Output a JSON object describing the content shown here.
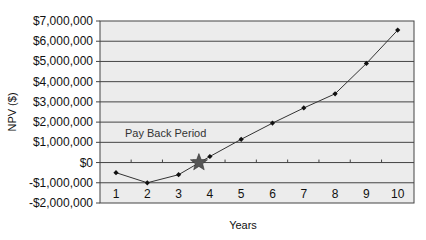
{
  "chart_data": {
    "type": "line",
    "title": "",
    "xlabel": "Years",
    "ylabel": "NPV ($)",
    "x": [
      1,
      2,
      3,
      4,
      5,
      6,
      7,
      8,
      9,
      10
    ],
    "categories": [
      "1",
      "2",
      "3",
      "4",
      "5",
      "6",
      "7",
      "8",
      "9",
      "10"
    ],
    "series": [
      {
        "name": "NPV",
        "values": [
          -500000,
          -1000000,
          -600000,
          300000,
          1150000,
          1950000,
          2700000,
          3400000,
          4900000,
          6550000
        ]
      }
    ],
    "yticks": [
      "$7,000,000",
      "$6,000,000",
      "$5,000,000",
      "$4,000,000",
      "$3,000,000",
      "$2,000,000",
      "$1,000,000",
      "$0",
      "-$1,000,000",
      "-$2,000,000"
    ],
    "ylim": [
      -2000000,
      7000000
    ],
    "grid": true,
    "legend": "none",
    "annotations": [
      {
        "text": "Pay Back Period",
        "marker": "star",
        "x": 3.65,
        "y": 0
      }
    ]
  },
  "colors": {
    "plot_bg": "#ececec",
    "grid": "#444444",
    "line": "#333333",
    "marker": "#111111",
    "star": "#555555"
  }
}
